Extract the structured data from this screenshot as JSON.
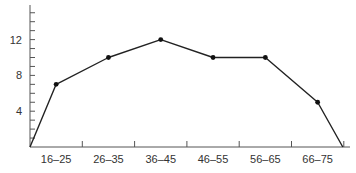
{
  "chart_data": {
    "type": "line",
    "title": "",
    "xlabel": "",
    "ylabel": "",
    "categories": [
      "16–25",
      "26–35",
      "36–45",
      "46–55",
      "56–65",
      "66–75"
    ],
    "values": [
      7,
      10,
      12,
      10,
      10,
      5
    ],
    "line_start": {
      "x": "origin",
      "y": 0
    },
    "line_end": {
      "x": "after 66–75",
      "y": 0
    },
    "yticks_labeled": [
      "4",
      "8",
      "12"
    ],
    "ytick_values": [
      4,
      8,
      12
    ],
    "ylim": [
      0,
      15.5
    ],
    "minor_yticks_every": 1,
    "grid": false,
    "legend": null,
    "colors": {
      "line": "#222222",
      "axis": "#555555",
      "marker": "#111111"
    }
  }
}
